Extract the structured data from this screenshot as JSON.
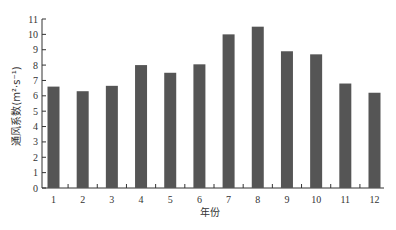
{
  "chart_data": {
    "type": "bar",
    "title": "",
    "xlabel": "年份",
    "ylabel": "通风系数(m²·s⁻¹)",
    "categories": [
      "1",
      "2",
      "3",
      "4",
      "5",
      "6",
      "7",
      "8",
      "9",
      "10",
      "11",
      "12"
    ],
    "values": [
      6.6,
      6.3,
      6.65,
      8.0,
      7.5,
      8.05,
      10.0,
      10.5,
      8.9,
      8.7,
      6.8,
      6.2
    ],
    "ylim": [
      0,
      11
    ],
    "yticks": [
      0,
      1,
      2,
      3,
      4,
      5,
      6,
      7,
      8,
      9,
      10,
      11
    ],
    "grid": false,
    "legend": null,
    "bar_color": "#555555"
  }
}
